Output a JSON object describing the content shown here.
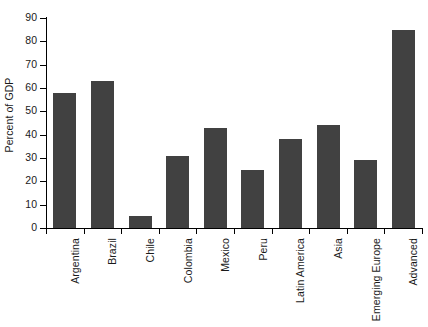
{
  "chart_data": {
    "type": "bar",
    "title": "",
    "xlabel": "",
    "ylabel": "Percent of GDP",
    "categories": [
      "Argentina",
      "Brazil",
      "Chile",
      "Colombia",
      "Mexico",
      "Peru",
      "Latin America",
      "Asia",
      "Emerging Europe",
      "Advanced"
    ],
    "values": [
      58,
      63,
      5,
      31,
      43,
      25,
      38,
      44,
      29,
      85
    ],
    "ylim": [
      0,
      90
    ],
    "ytick_step": 10,
    "yticks": [
      0,
      10,
      20,
      30,
      40,
      50,
      60,
      70,
      80,
      90
    ],
    "ytick_labels": [
      "0",
      "10",
      "20",
      "30",
      "40",
      "50",
      "60",
      "70",
      "80",
      "90"
    ],
    "grid": false,
    "legend": null,
    "bar_color": "#414141",
    "axis_color": "#000000",
    "background_color": "#ffffff"
  }
}
